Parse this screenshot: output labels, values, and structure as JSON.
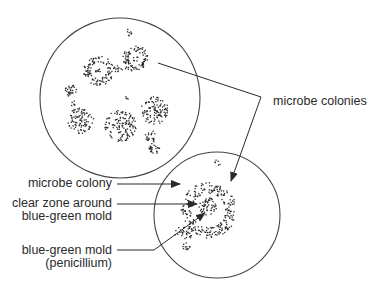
{
  "diagram": {
    "colors": {
      "ink": "#2a2a2a",
      "background": "#ffffff"
    },
    "dishes": [
      {
        "id": "dish-top",
        "cx": 120,
        "cy": 98,
        "r": 80
      },
      {
        "id": "dish-bottom",
        "cx": 217,
        "cy": 215,
        "r": 63
      }
    ],
    "labels": {
      "microbe_colonies": "microbe colonies",
      "microbe_colony": "microbe colony",
      "clear_zone_line1": "clear zone around",
      "clear_zone_line2": "blue-green mold",
      "mold_line1": "blue-green mold",
      "mold_line2": "(penicillium)"
    }
  }
}
